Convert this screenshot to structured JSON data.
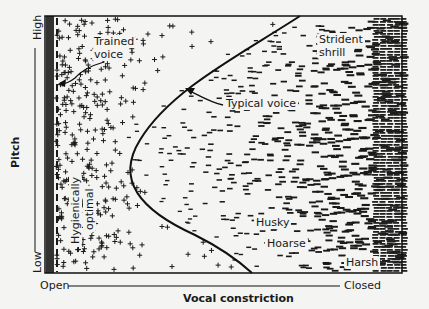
{
  "figure": {
    "y_axis": {
      "label": "Pitch",
      "high_label": "High",
      "low_label": "Low"
    },
    "x_axis": {
      "label": "Vocal constriction",
      "open_label": "Open",
      "closed_label": "Closed"
    },
    "regions": {
      "trained_voice": "Trained voice",
      "trained_voice_line1": "Trained",
      "trained_voice_line2": "voice",
      "hygienically_optimal_line1": "Hygienically",
      "hygienically_optimal_line2": "optimal",
      "typical_voice": "Typical voice",
      "strident_line1": "Strident",
      "strident_line2": "shrill",
      "husky": "Husky",
      "hoarse": "Hoarse",
      "harsh": "Harsh"
    },
    "legend_symbols": {
      "open_marker": "+",
      "constricted_marker": "–"
    },
    "colors": {
      "ink": "#1a1a1a",
      "paper": "#f4f4f2"
    }
  }
}
